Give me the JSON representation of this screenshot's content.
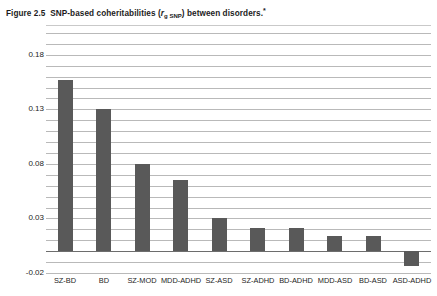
{
  "title": {
    "prefix": "Figure 2.5",
    "main_before": "SNP-based coheritabilities (",
    "symbol_r": "r",
    "symbol_sub": "g SNP",
    "main_after": ") between disorders.",
    "footnote_marker": "*",
    "full_text": "Figure 2.5  SNP-based coheritabilities (rg SNP) between disorders.*"
  },
  "axes": {
    "y_ticks": [
      "0.18",
      "0.13",
      "0.08",
      "0.03",
      "-0.02"
    ],
    "y_tick_values": [
      0.18,
      0.13,
      0.08,
      0.03,
      -0.02
    ],
    "y_min": -0.02,
    "y_max": 0.2,
    "gridline_step": 0.01,
    "x_label": "",
    "y_label": ""
  },
  "style": {
    "bar_color": "#595959",
    "gridline_color": "#b9b9b9",
    "zero_line_color": "#6d6d6d",
    "background": "#ffffff",
    "text_color": "#1c1c1c"
  },
  "chart_data": {
    "type": "bar",
    "xlabel": "",
    "ylabel": "",
    "ylim": [
      -0.02,
      0.2
    ],
    "grid": true,
    "legend": "none",
    "categories": [
      "SZ-BD",
      "BD",
      "SZ-MOD",
      "MDD-ADHD",
      "SZ-ASD",
      "SZ-ADHD",
      "BD-ADHD",
      "MDD-ASD",
      "BD-ASD",
      "ASD-ADHD"
    ],
    "values": [
      0.157,
      0.13,
      0.08,
      0.065,
      0.03,
      0.021,
      0.021,
      0.014,
      0.014,
      -0.014
    ],
    "series": [
      {
        "name": "SNP-based coheritability",
        "values": [
          0.157,
          0.13,
          0.08,
          0.065,
          0.03,
          0.021,
          0.021,
          0.014,
          0.014,
          -0.014
        ]
      }
    ]
  }
}
